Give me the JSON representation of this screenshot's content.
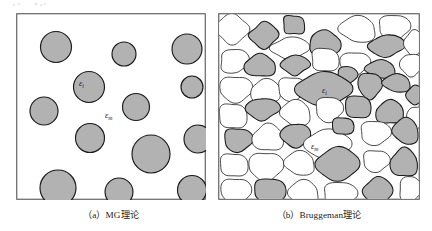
{
  "figure": {
    "background_color": "#ffffff",
    "panel_border_color": "#555555",
    "outline_color": "#1a1a1a",
    "inclusion_fill": "#b2b2b2",
    "matrix_fill": "#ffffff",
    "label_color": "#1b1b1b"
  },
  "panels": [
    {
      "id": "a",
      "caption": "（a）MG理论",
      "theory_name": "MG",
      "labels": [
        {
          "name": "inclusion-permittivity-label",
          "text": "ε",
          "subscript": "i",
          "x": 63,
          "y": 73
        },
        {
          "name": "matrix-permittivity-label",
          "text": "ε",
          "subscript": "m",
          "x": 89,
          "y": 105
        }
      ],
      "circles": [
        {
          "cx": 40,
          "cy": 34,
          "r": 15.5
        },
        {
          "cx": 108,
          "cy": 41,
          "r": 12.0
        },
        {
          "cx": 171,
          "cy": 36,
          "r": 15.0
        },
        {
          "cx": 73,
          "cy": 74,
          "r": 15.5
        },
        {
          "cx": 176,
          "cy": 74,
          "r": 11.0
        },
        {
          "cx": 28,
          "cy": 98,
          "r": 14.0
        },
        {
          "cx": 120,
          "cy": 94,
          "r": 13.5
        },
        {
          "cx": 74,
          "cy": 125,
          "r": 14.5
        },
        {
          "cx": 135,
          "cy": 141,
          "r": 19.0
        },
        {
          "cx": 182,
          "cy": 126,
          "r": 14.0
        },
        {
          "cx": 42,
          "cy": 175,
          "r": 18.0
        },
        {
          "cx": 103,
          "cy": 179,
          "r": 14.0
        },
        {
          "cx": 176,
          "cy": 177,
          "r": 14.5
        }
      ]
    },
    {
      "id": "b",
      "caption": "（b）Bruggeman理论",
      "theory_name": "Bruggeman",
      "labels": [
        {
          "name": "inclusion-permittivity-label",
          "text": "ε",
          "subscript": "i",
          "x": 104,
          "y": 80
        },
        {
          "name": "matrix-permittivity-label",
          "text": "ε",
          "subscript": "m",
          "x": 93,
          "y": 136
        }
      ]
    }
  ],
  "chart_data": {
    "type": "diagram",
    "items": [
      {
        "label": "（a）MG理论",
        "model": "Maxwell-Garnett",
        "structure": "isolated spherical inclusions dispersed in a continuous matrix",
        "inclusion_count": 13,
        "inclusion_symbol": "εi",
        "matrix_symbol": "εm"
      },
      {
        "label": "（b）Bruggeman理论",
        "model": "Bruggeman",
        "structure": "interpenetrating irregular grains, both phases continuous",
        "inclusion_symbol": "εi",
        "matrix_symbol": "εm"
      }
    ]
  }
}
